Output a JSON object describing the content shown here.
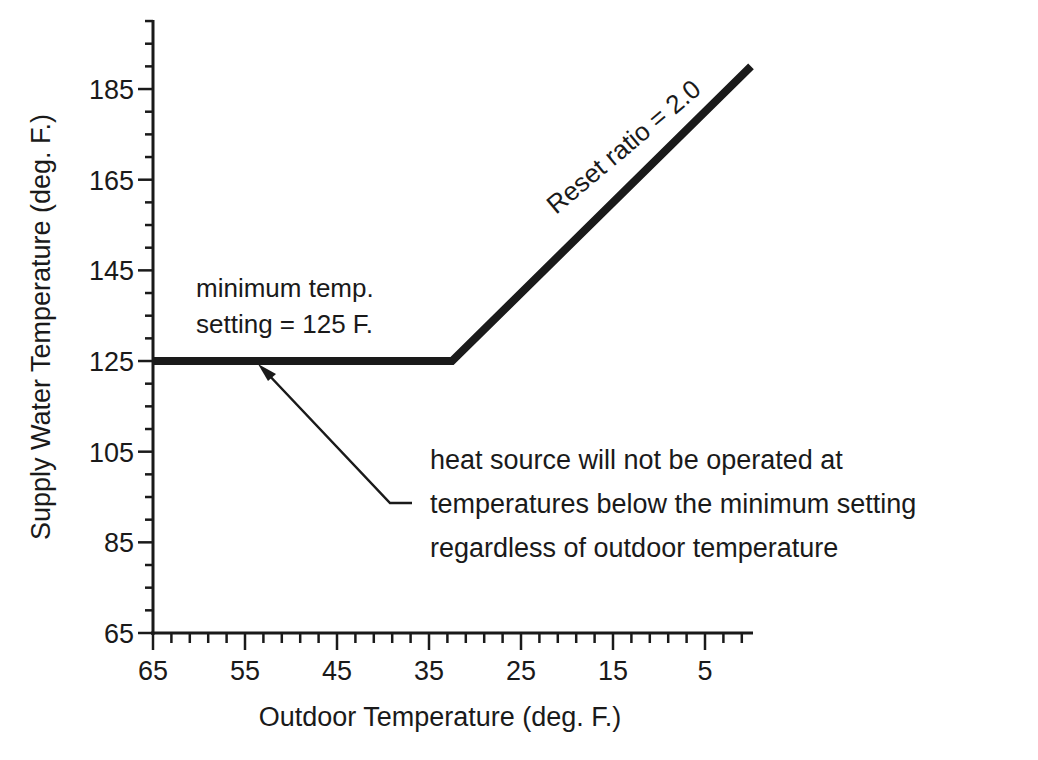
{
  "chart_data": {
    "type": "line",
    "title": "",
    "xlabel": "Outdoor Temperature (deg. F.)",
    "ylabel": "Supply Water Temperature (deg. F.)",
    "x_reversed": true,
    "xlim": [
      65,
      0
    ],
    "ylim": [
      65,
      200
    ],
    "x_ticks": [
      65,
      55,
      45,
      35,
      25,
      15,
      5
    ],
    "y_ticks": [
      65,
      85,
      105,
      125,
      145,
      165,
      185
    ],
    "x_tick_labels": [
      "65",
      "55",
      "45",
      "35",
      "25",
      "15",
      "5"
    ],
    "y_tick_labels": [
      "65",
      "85",
      "105",
      "125",
      "145",
      "165",
      "185"
    ],
    "x_minor_step": 2,
    "y_minor_step": 5,
    "grid": false,
    "legend": null,
    "series": [
      {
        "name": "Supply water temperature reset curve",
        "x": [
          65,
          32.5,
          0
        ],
        "y": [
          125,
          125,
          190
        ]
      }
    ],
    "annotations": [
      {
        "text_lines": [
          "minimum temp.",
          "setting = 125 F."
        ],
        "target": "flat segment at 125 F"
      },
      {
        "text": "Reset ratio = 2.0",
        "target": "sloped segment",
        "rotation_deg": -40
      },
      {
        "text_lines": [
          "heat source will not be operated at",
          "temperatures below the minimum setting",
          "regardless of outdoor temperature"
        ],
        "arrow_to": [
          53,
          125
        ]
      }
    ]
  },
  "axis": {
    "x_title": "Outdoor Temperature (deg. F.)",
    "y_title": "Supply Water Temperature (deg. F.)",
    "x_ticks": [
      "65",
      "55",
      "45",
      "35",
      "25",
      "15",
      "5"
    ],
    "y_ticks": [
      "65",
      "85",
      "105",
      "125",
      "145",
      "165",
      "185"
    ]
  },
  "annotations": {
    "min_setting_line1": "minimum temp.",
    "min_setting_line2": "setting = 125 F.",
    "reset_ratio": "Reset ratio = 2.0",
    "note_line1": "heat source will not be operated at",
    "note_line2": "temperatures below the minimum setting",
    "note_line3": "regardless of outdoor temperature"
  },
  "colors": {
    "ink": "#1a1a1a",
    "background": "#ffffff"
  }
}
